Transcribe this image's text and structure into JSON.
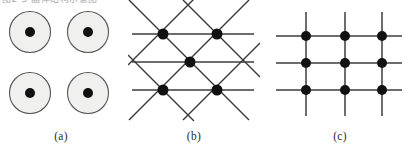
{
  "figure": {
    "background_color": "#ffffff",
    "clipped_header_text": "图2-3 晶体结构示意图",
    "width": 412,
    "height": 154
  },
  "colors": {
    "line": "#3c3c3c",
    "node_fill": "#111111",
    "circle_outline": "#555555",
    "circle_fill": "#f0f0ee",
    "caption_text": "#2b2b2b"
  },
  "panels": [
    {
      "id": "panel-a",
      "caption": "(a)",
      "kind": "circles-with-centers",
      "description": "four outlined circles each containing a filled center dot",
      "circle_radius": 20.5,
      "dot_radius": 5,
      "circles": [
        {
          "cx": 30,
          "cy": 32
        },
        {
          "cx": 88,
          "cy": 32
        },
        {
          "cx": 30,
          "cy": 93
        },
        {
          "cx": 88,
          "cy": 93
        }
      ]
    },
    {
      "id": "panel-b",
      "caption": "(b)",
      "kind": "triangular-lattice",
      "description": "centred rectangular lattice: horizontal rows plus diagonal bonds through a central node",
      "node_radius": 5.5,
      "nodes": [
        {
          "cx": 35,
          "cy": 34
        },
        {
          "cx": 89,
          "cy": 34
        },
        {
          "cx": 62,
          "cy": 62
        },
        {
          "cx": 35,
          "cy": 90
        },
        {
          "cx": 89,
          "cy": 90
        }
      ],
      "horizontal_rows_y": [
        34,
        62,
        90
      ],
      "diagonal_slope": 1.0
    },
    {
      "id": "panel-c",
      "caption": "(c)",
      "kind": "square-lattice",
      "description": "3 by 3 square lattice of nodes joined by horizontal and vertical lines that overhang the nodes",
      "node_radius": 5,
      "columns_x": [
        38,
        77,
        114
      ],
      "rows_y": [
        36,
        63,
        90
      ],
      "nodes": [
        {
          "cx": 38,
          "cy": 36
        },
        {
          "cx": 77,
          "cy": 36
        },
        {
          "cx": 114,
          "cy": 36
        },
        {
          "cx": 38,
          "cy": 63
        },
        {
          "cx": 77,
          "cy": 63
        },
        {
          "cx": 114,
          "cy": 63
        },
        {
          "cx": 38,
          "cy": 90
        },
        {
          "cx": 77,
          "cy": 90
        },
        {
          "cx": 114,
          "cy": 90
        }
      ]
    }
  ]
}
